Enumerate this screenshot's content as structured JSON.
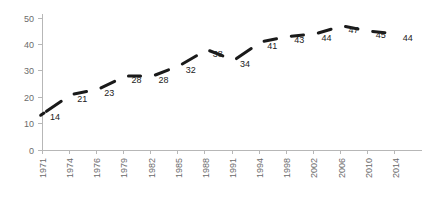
{
  "chart_data": {
    "type": "line",
    "title": "",
    "subtitle": "",
    "xlabel": "",
    "ylabel": "",
    "categories": [
      "1971",
      "1974",
      "1976",
      "1979",
      "1982",
      "1985",
      "1988",
      "1991",
      "1994",
      "1998",
      "2002",
      "2006",
      "2010",
      "2014"
    ],
    "values": [
      14,
      21,
      23,
      28,
      28,
      32,
      38,
      34,
      41,
      43,
      44,
      47,
      45,
      44
    ],
    "data_labels": [
      "14",
      "21",
      "23",
      "28",
      "28",
      "32",
      "38",
      "34",
      "41",
      "43",
      "44",
      "47",
      "45",
      "44"
    ],
    "ylim": [
      0,
      50
    ],
    "yticks": [
      0,
      10,
      20,
      30,
      40,
      50
    ],
    "ytick_labels": [
      "0",
      "10",
      "20",
      "30",
      "40",
      "50"
    ],
    "grid": false,
    "legend": null,
    "legend_position": "none",
    "series": [
      {
        "name": "",
        "values": [
          14,
          21,
          23,
          28,
          28,
          32,
          38,
          34,
          41,
          43,
          44,
          47,
          45,
          44
        ]
      }
    ],
    "colors": {
      "line": "#1a1a1a",
      "axis": "#b7b7b7",
      "tick_label": "#6b6b6b",
      "data_label": "#222222",
      "background": "#ffffff"
    },
    "markers": false,
    "line_width": 3,
    "label_position": "below-right"
  }
}
